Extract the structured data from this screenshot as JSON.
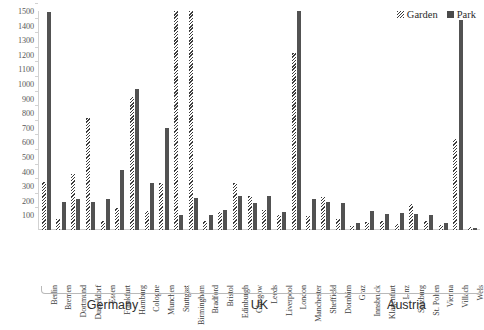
{
  "chart_data": {
    "type": "bar",
    "title": "",
    "xlabel": "",
    "ylabel": "",
    "ylim": [
      0,
      1500
    ],
    "ytick_step": 100,
    "yticks": [
      1500,
      1400,
      1300,
      1200,
      1100,
      1000,
      900,
      800,
      700,
      600,
      500,
      400,
      300,
      200,
      100
    ],
    "grid": false,
    "legend_position": "top-right",
    "categories": [
      "Berlin",
      "Bremen",
      "Dortmund",
      "Dusseldorf",
      "Essen",
      "Frankfurt",
      "Hamburg",
      "Cologne",
      "Munchen",
      "Stuttgart",
      "Birmingham",
      "Bradford",
      "Bristol",
      "Edinburgh",
      "Glasgow",
      "Leeds",
      "Liverpool",
      "London",
      "Manchester",
      "Sheffield",
      "Dornbirn",
      "Graz",
      "Innsbruck",
      "Klagenfurt",
      "Linz",
      "Salzburg",
      "St. Polten",
      "Vienna",
      "Villach",
      "Wels"
    ],
    "series": [
      {
        "name": "Garden",
        "color": "#3d3d3d",
        "pattern": "diagonal-hatch",
        "values": [
          330,
          75,
          385,
          765,
          60,
          150,
          910,
          130,
          325,
          1500,
          1500,
          60,
          120,
          325,
          230,
          135,
          100,
          1215,
          95,
          225,
          75,
          30,
          55,
          60,
          40,
          175,
          60,
          35,
          620,
          20
        ]
      },
      {
        "name": "Park",
        "color": "#525252",
        "pattern": "solid",
        "values": [
          1495,
          195,
          215,
          195,
          215,
          410,
          965,
          325,
          700,
          105,
          220,
          100,
          140,
          230,
          185,
          235,
          120,
          1500,
          210,
          195,
          185,
          45,
          130,
          110,
          115,
          110,
          105,
          45,
          1440,
          15
        ]
      }
    ],
    "groups": [
      {
        "label": "Germany",
        "start_index": 0,
        "end_index": 9
      },
      {
        "label": "UK",
        "start_index": 10,
        "end_index": 19
      },
      {
        "label": "Austria",
        "start_index": 20,
        "end_index": 29
      }
    ]
  },
  "legend": {
    "entries": [
      {
        "label": "Garden",
        "icon": "hatched-swatch-icon"
      },
      {
        "label": "Park",
        "icon": "solid-swatch-icon"
      }
    ]
  }
}
